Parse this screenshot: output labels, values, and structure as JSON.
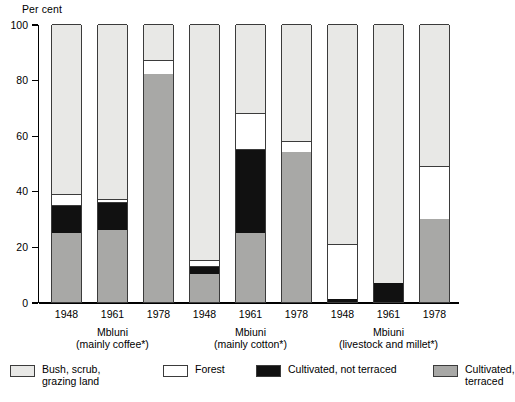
{
  "axis": {
    "y_title": "Per cent",
    "y_ticks": [
      "100",
      "80",
      "60",
      "40",
      "20",
      "0"
    ]
  },
  "groups": [
    {
      "name": "Mbluni",
      "subtitle": "(mainly coffee*)",
      "years": [
        "1948",
        "1961",
        "1978"
      ]
    },
    {
      "name": "Mbiuni",
      "subtitle": "(mainly cotton*)",
      "years": [
        "1948",
        "1961",
        "1978"
      ]
    },
    {
      "name": "Mbiuni",
      "subtitle": "(livestock and millet*)",
      "years": [
        "1948",
        "1961",
        "1978"
      ]
    }
  ],
  "legend": {
    "position": "bottom",
    "items": [
      {
        "label": "Bush, scrub,\ngrazing land",
        "color": "#e8e8e6",
        "key": "bush"
      },
      {
        "label": "Forest",
        "color": "#ffffff",
        "key": "forest"
      },
      {
        "label": "Cultivated, not terraced",
        "color": "#111111",
        "key": "notterr"
      },
      {
        "label": "Cultivated, terraced",
        "color": "#a8a8a6",
        "key": "terraced"
      }
    ]
  },
  "chart_data": {
    "type": "bar",
    "subtype": "stacked-vertical-grouped",
    "title": "",
    "xlabel": "",
    "ylabel": "Per cent",
    "ylim": [
      0,
      100
    ],
    "yticks": [
      0,
      20,
      40,
      60,
      80,
      100
    ],
    "grid": false,
    "legend_position": "bottom",
    "categories": [
      "Mbluni (mainly coffee*) 1948",
      "Mbluni (mainly coffee*) 1961",
      "Mbluni (mainly coffee*) 1978",
      "Mbiuni (mainly cotton*) 1948",
      "Mbiuni (mainly cotton*) 1961",
      "Mbiuni (mainly cotton*) 1978",
      "Mbiuni (livestock and millet*) 1948",
      "Mbiuni (livestock and millet*) 1961",
      "Mbiuni (livestock and millet*) 1978"
    ],
    "series": [
      {
        "name": "Cultivated, terraced",
        "color": "#a8a8a6",
        "values": [
          25,
          26,
          82,
          10,
          25,
          54,
          0,
          0,
          30
        ]
      },
      {
        "name": "Cultivated, not terraced",
        "color": "#111111",
        "values": [
          10,
          10,
          0,
          3,
          30,
          0,
          1,
          7,
          0
        ]
      },
      {
        "name": "Forest",
        "color": "#ffffff",
        "values": [
          4,
          1,
          5,
          2,
          13,
          4,
          20,
          0,
          19
        ]
      },
      {
        "name": "Bush, scrub, grazing land",
        "color": "#e8e8e6",
        "values": [
          61,
          63,
          13,
          85,
          32,
          42,
          79,
          93,
          51
        ]
      }
    ]
  }
}
